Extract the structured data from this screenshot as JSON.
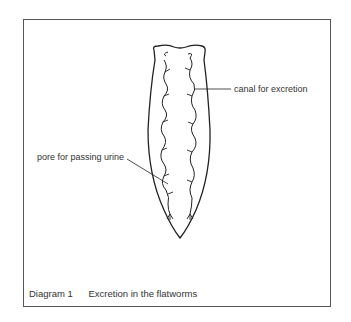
{
  "diagram": {
    "labels": {
      "canal": "canal for excretion",
      "pore": "pore for passing urine"
    },
    "caption": {
      "number": "Diagram 1",
      "title": "Excretion in the flatworms"
    },
    "colors": {
      "line": "#222222",
      "frame": "#555555",
      "text": "#333333"
    }
  }
}
